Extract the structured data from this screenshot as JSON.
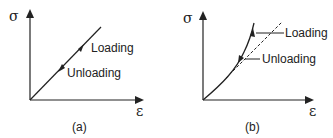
{
  "figure": {
    "panels": [
      {
        "id": "a",
        "caption": "(a)",
        "y_axis_label": "σ",
        "x_axis_label": "ε",
        "annotations": {
          "loading": "Loading",
          "unloading": "Unloading"
        },
        "description": "Linear stress-strain: loading and unloading follow the same straight line"
      },
      {
        "id": "b",
        "caption": "(b)",
        "y_axis_label": "σ",
        "x_axis_label": "ε",
        "annotations": {
          "loading": "Loading",
          "unloading": "Unloading"
        },
        "description": "Nonlinear stress-strain: loading and unloading follow the same curve; dashed straight reference line"
      }
    ],
    "colors": {
      "line": "#222222",
      "background": "#ffffff"
    }
  }
}
